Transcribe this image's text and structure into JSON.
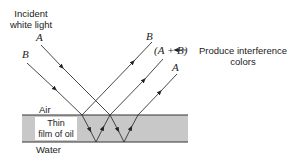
{
  "labels": {
    "incident_line1": "Incident",
    "incident_line2": "white light",
    "ray_a_in": "A",
    "ray_b_in": "B",
    "ray_b_out": "B",
    "ray_ab_out": "(A + B)",
    "ray_a_out": "A",
    "annotation_line1": "Produce interference",
    "annotation_line2": "colors",
    "air": "Air",
    "film_line1": "Thin",
    "film_line2": "film of oil",
    "water": "Water"
  },
  "colors": {
    "film_fill": "#c8c8c8",
    "line": "#333333"
  }
}
